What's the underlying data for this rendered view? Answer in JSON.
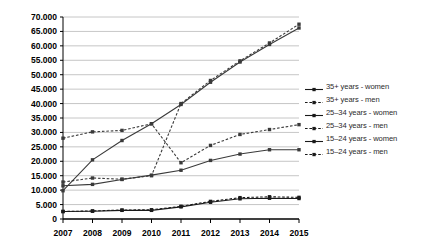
{
  "chart_data": {
    "type": "line",
    "title": "",
    "xlabel": "",
    "ylabel": "",
    "x": [
      "2007",
      "2008",
      "2009",
      "2010",
      "2011",
      "2012",
      "2013",
      "2014",
      "2015"
    ],
    "ylim": [
      0,
      70000
    ],
    "ytick_step": 5000,
    "grid": true,
    "legend_position": "right",
    "ytick_labels": [
      "70.000",
      "65.000",
      "60.000",
      "55.000",
      "50.000",
      "45.000",
      "40.000",
      "35.000",
      "30.000",
      "25.000",
      "20.000",
      "15.000",
      "10.000",
      "5.000",
      "0"
    ],
    "ytick_values": [
      70000,
      65000,
      60000,
      55000,
      50000,
      45000,
      40000,
      35000,
      30000,
      25000,
      20000,
      15000,
      10000,
      5000,
      0
    ],
    "series": [
      {
        "name": "35+ years - women",
        "style": "solid",
        "color": "#3a3a3a",
        "values": [
          9800,
          20500,
          27200,
          33000,
          39700,
          47400,
          54400,
          60500,
          66200
        ]
      },
      {
        "name": "35+ years - men",
        "style": "dashed",
        "color": "#3a3a3a",
        "values": [
          12800,
          14200,
          13800,
          15000,
          40000,
          48000,
          54800,
          61000,
          67500
        ]
      },
      {
        "name": "25-34 years - women",
        "style": "solid",
        "color": "#3a3a3a",
        "values": [
          11500,
          12000,
          13700,
          15200,
          16900,
          20300,
          22500,
          24000,
          24000
        ]
      },
      {
        "name": "25-34 years - men",
        "style": "dashed",
        "color": "#3a3a3a",
        "values": [
          28000,
          30200,
          30700,
          33000,
          19500,
          25500,
          29300,
          31000,
          32700
        ]
      },
      {
        "name": "15-24 years - women",
        "style": "solid",
        "color": "#1a1a1a",
        "values": [
          2600,
          2700,
          3000,
          3000,
          4200,
          5800,
          7000,
          7200,
          7100
        ]
      },
      {
        "name": "15-24 years - men",
        "style": "dashed",
        "color": "#1a1a1a",
        "values": [
          2600,
          2800,
          3100,
          3200,
          4400,
          6100,
          7400,
          7700,
          7500
        ]
      }
    ]
  },
  "legend": {
    "items": [
      {
        "label": "35+ years - women",
        "style": "solid"
      },
      {
        "label": "35+ years - men",
        "style": "dashed"
      },
      {
        "label": "25–34 years - women",
        "style": "solid"
      },
      {
        "label": "25–34 years - men",
        "style": "dashed"
      },
      {
        "label": "15–24 years - women",
        "style": "solid"
      },
      {
        "label": "15–24 years - men",
        "style": "dashed"
      }
    ]
  },
  "colors": {
    "axis": "#000000",
    "grid": "#b8b8b8",
    "line": "#4a4a4a",
    "line_dark": "#1a1a1a",
    "background": "#ffffff"
  }
}
